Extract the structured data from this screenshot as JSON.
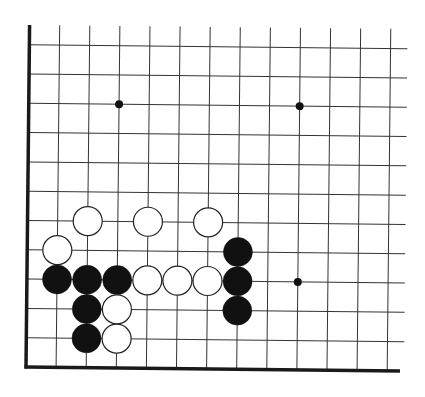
{
  "board": {
    "type": "go-diagram",
    "description": "Lower-left corner of a Go board",
    "grid": {
      "columns": 13,
      "rows": 12,
      "origin_x": 26,
      "origin_y": 367,
      "spacing_x": 30.1,
      "spacing_y": 29.3,
      "line_extend_right": 404,
      "line_top": 25,
      "line_color": "#333333",
      "edge_color": "#1a1a1a"
    },
    "star_points": [
      {
        "col": 3,
        "row": 9
      },
      {
        "col": 9,
        "row": 9
      },
      {
        "col": 9,
        "row": 3
      }
    ],
    "stones": [
      {
        "color": "white",
        "col": 2,
        "row": 5
      },
      {
        "color": "white",
        "col": 4,
        "row": 5
      },
      {
        "color": "white",
        "col": 6,
        "row": 5
      },
      {
        "color": "white",
        "col": 1,
        "row": 4
      },
      {
        "color": "black",
        "col": 7,
        "row": 4
      },
      {
        "color": "black",
        "col": 1,
        "row": 3
      },
      {
        "color": "black",
        "col": 2,
        "row": 3
      },
      {
        "color": "black",
        "col": 3,
        "row": 3
      },
      {
        "color": "white",
        "col": 4,
        "row": 3
      },
      {
        "color": "white",
        "col": 5,
        "row": 3
      },
      {
        "color": "white",
        "col": 6,
        "row": 3
      },
      {
        "color": "black",
        "col": 7,
        "row": 3
      },
      {
        "color": "black",
        "col": 2,
        "row": 2
      },
      {
        "color": "white",
        "col": 3,
        "row": 2
      },
      {
        "color": "black",
        "col": 7,
        "row": 2
      },
      {
        "color": "black",
        "col": 2,
        "row": 1
      },
      {
        "color": "white",
        "col": 3,
        "row": 1
      }
    ],
    "colors": {
      "black_stone": "#111111",
      "white_stone_fill": "#ffffff",
      "white_stone_stroke": "#222222",
      "background": "#ffffff"
    }
  }
}
